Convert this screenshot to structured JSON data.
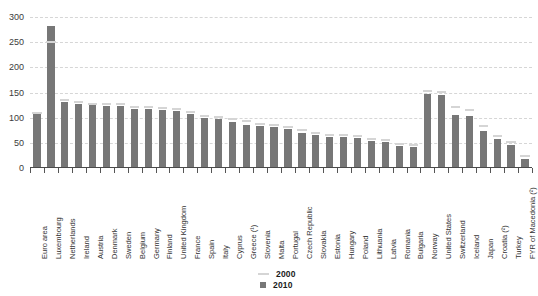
{
  "title": "",
  "legend": {
    "position": "bottom-center",
    "entries": [
      {
        "label": "2000",
        "marker": "line",
        "color": "#d5d5d5"
      },
      {
        "label": "2010",
        "marker": "square",
        "color": "#777777"
      }
    ]
  },
  "axis": {
    "y_ticks": [
      "0",
      "50",
      "100",
      "150",
      "200",
      "250",
      "300"
    ]
  },
  "chart_data": {
    "type": "bar",
    "title": "",
    "xlabel": "",
    "ylabel": "",
    "ylim": [
      0,
      300
    ],
    "yticks": [
      0,
      50,
      100,
      150,
      200,
      250,
      300
    ],
    "grid": true,
    "legend_position": "bottom-center",
    "categories": [
      "Euro area",
      "Luxembourg",
      "Netherlands",
      "Ireland",
      "Austria",
      "Denmark",
      "Sweden",
      "Belgium",
      "Germany",
      "Finland",
      "United Kingdom",
      "France",
      "Spain",
      "Italy",
      "Cyprus",
      "Greece (¹)",
      "Slovenia",
      "Malta",
      "Portugal",
      "Czech Republic",
      "Slovakia",
      "Estonia",
      "Hungary",
      "Poland",
      "Lithuania",
      "Latvia",
      "Romania",
      "Bulgaria",
      "Norway",
      "United States",
      "Switzerland",
      "Iceland",
      "Japan",
      "Croatia (²)",
      "Turkey",
      "FYR of Macedonia (²)"
    ],
    "series": [
      {
        "name": "2010",
        "marker": "bar",
        "color": "#777777",
        "values": [
          110,
          282,
          131,
          128,
          125,
          124,
          123,
          118,
          117,
          116,
          113,
          107,
          99,
          98,
          92,
          86,
          84,
          82,
          78,
          70,
          65,
          62,
          61,
          59,
          54,
          51,
          44,
          42,
          147,
          145,
          105,
          103,
          74,
          58,
          46,
          18
        ]
      },
      {
        "name": "2000",
        "marker": "line",
        "color": "#d5d5d5",
        "values": [
          108,
          248,
          133,
          130,
          126,
          126,
          125,
          120,
          119,
          118,
          116,
          110,
          101,
          100,
          96,
          91,
          86,
          84,
          80,
          73,
          67,
          64,
          63,
          61,
          56,
          53,
          46,
          44,
          152,
          150,
          119,
          114,
          82,
          62,
          50,
          22
        ]
      }
    ]
  }
}
